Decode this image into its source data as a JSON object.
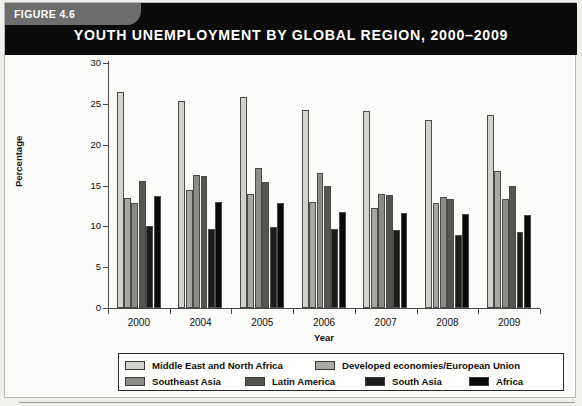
{
  "figure": {
    "tab_label": "FIGURE 4.6",
    "title": "YOUTH UNEMPLOYMENT BY GLOBAL REGION, 2000–2009"
  },
  "chart_data": {
    "type": "bar",
    "title": "YOUTH UNEMPLOYMENT BY GLOBAL REGION, 2000–2009",
    "xlabel": "Year",
    "ylabel": "Percentage",
    "categories": [
      "2000",
      "2004",
      "2005",
      "2006",
      "2007",
      "2008",
      "2009"
    ],
    "ylim": [
      0,
      30
    ],
    "yticks": [
      0,
      5,
      10,
      15,
      20,
      25,
      30
    ],
    "grid": false,
    "legend_position": "bottom",
    "series": [
      {
        "name": "Middle East and North Africa",
        "color": "#d2d2cd",
        "values": [
          26.5,
          25.3,
          25.8,
          24.2,
          24.1,
          23.0,
          23.6
        ]
      },
      {
        "name": "Developed economies/European Union",
        "color": "#a8a8a3",
        "values": [
          13.5,
          14.5,
          14.0,
          13.0,
          12.2,
          12.8,
          16.8
        ]
      },
      {
        "name": "Southeast Asia",
        "color": "#8c8c87",
        "values": [
          12.9,
          16.3,
          17.1,
          16.5,
          14.0,
          13.6,
          13.3
        ]
      },
      {
        "name": "Latin America",
        "color": "#565651",
        "values": [
          15.6,
          16.2,
          15.4,
          15.0,
          13.8,
          13.3,
          15.0
        ]
      },
      {
        "name": "South Asia",
        "color": "#1c1c1a",
        "values": [
          10.1,
          9.7,
          9.9,
          9.7,
          9.5,
          8.9,
          9.3
        ]
      },
      {
        "name": "Africa",
        "color": "#0a0a0a",
        "values": [
          13.7,
          13.0,
          12.8,
          11.8,
          11.6,
          11.5,
          11.4
        ]
      }
    ]
  }
}
